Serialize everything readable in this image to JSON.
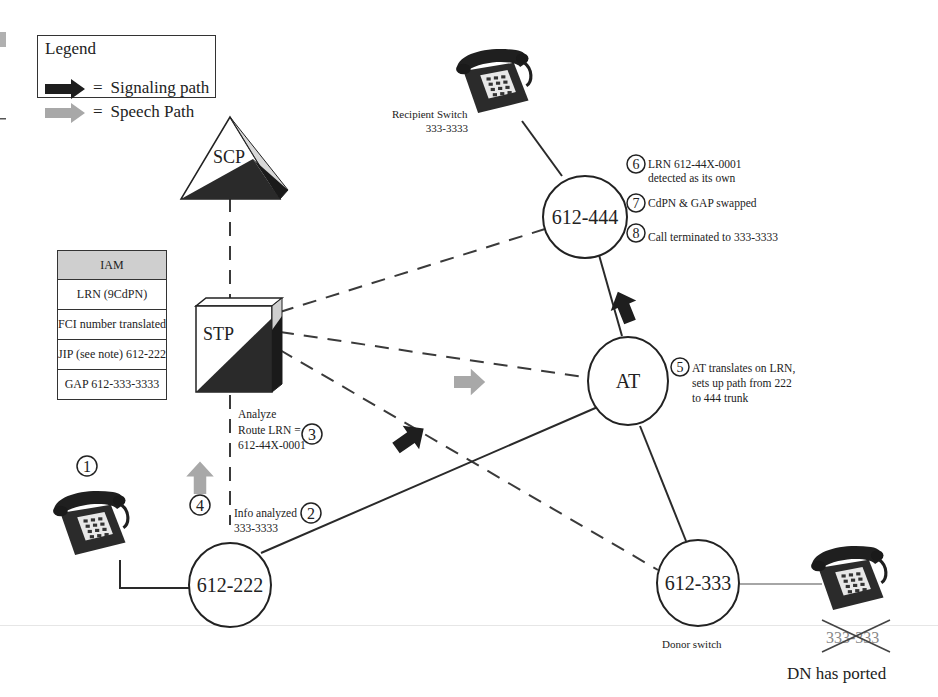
{
  "legend": {
    "title": "Legend",
    "items": [
      {
        "label": "Signaling path",
        "symbol": "=",
        "arrow_color": "#1e1e1e"
      },
      {
        "label": "Speech Path",
        "symbol": "=",
        "arrow_color": "#a8a8a8"
      }
    ]
  },
  "nodes": {
    "scp": {
      "label": "SCP"
    },
    "stp": {
      "label": "STP"
    },
    "at": {
      "label": "AT"
    },
    "switch_444": {
      "label": "612-444"
    },
    "switch_222": {
      "label": "612-222"
    },
    "switch_333": {
      "label": "612-333"
    }
  },
  "iam_table": {
    "header": "IAM",
    "rows": [
      "LRN (9CdPN)",
      "FCI number translated",
      "JIP (see note) 612-222",
      "GAP 612-333-3333"
    ]
  },
  "labels": {
    "recipient_switch": {
      "line1": "Recipient Switch",
      "line2": "333-3333"
    },
    "donor_switch": "Donor switch",
    "ported_number": "333-333",
    "dn_ported": "DN has ported"
  },
  "steps": [
    {
      "num": "1",
      "text": []
    },
    {
      "num": "2",
      "text": [
        "Info analyzed",
        "333-3333"
      ]
    },
    {
      "num": "3",
      "text": [
        "Analyze",
        "Route LRN  =",
        "612-44X-0001"
      ]
    },
    {
      "num": "4",
      "text": []
    },
    {
      "num": "5",
      "text": [
        "AT translates on LRN,",
        "sets up path from 222",
        "to 444 trunk"
      ]
    },
    {
      "num": "6",
      "text": [
        "LRN 612-44X-0001",
        "detected as its own"
      ]
    },
    {
      "num": "7",
      "text": [
        "CdPN & GAP swapped"
      ]
    },
    {
      "num": "8",
      "text": [
        "Call terminated to 333-3333"
      ]
    }
  ],
  "colors": {
    "signaling": "#1e1e1e",
    "speech": "#a8a8a8",
    "line": "#2a2a2a",
    "phone_body": "#2b2b2b",
    "iam_header": "#cfcfcf"
  }
}
